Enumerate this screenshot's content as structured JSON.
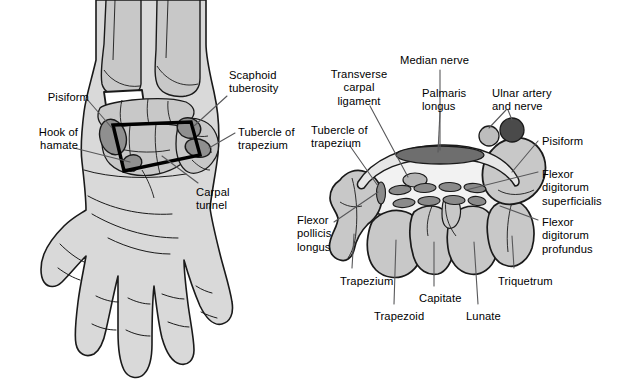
{
  "figure": {
    "background_color": "#ffffff",
    "line_color": "#1a1a1a",
    "leader_color": "#58585a",
    "fill_skin": "#d9d9d9",
    "fill_bone": "#c8c8c8",
    "fill_bone_dark": "#8f8f8f",
    "fill_tendon": "#8a8a8a",
    "fill_nerve": "#6e6e6e",
    "fill_artery": "#4a4a4a",
    "fill_tunnel_interior": "#f2f2f2"
  },
  "panels": [
    {
      "id": "left-panel",
      "name": "palmar-hand-view",
      "caption": "Palmar view of left hand showing the four bony boundaries of the carpal tunnel"
    },
    {
      "id": "right-panel",
      "name": "carpal-tunnel-cross-section",
      "caption": "Transverse cross-section through the carpal tunnel"
    }
  ],
  "labels_left": [
    {
      "key": "pisiform",
      "text": "Pisiform",
      "align": "right",
      "x": 42,
      "y": 91
    },
    {
      "key": "hook_of_hamate",
      "text": "Hook of\nhamate",
      "align": "right",
      "x": 29,
      "y": 126
    },
    {
      "key": "scaphoid_tuberosity",
      "text": "Scaphoid\ntuberosity",
      "align": "left",
      "x": 229,
      "y": 69
    },
    {
      "key": "tubercle_of_trapezium",
      "text": "Tubercle of\ntrapezium",
      "align": "left",
      "x": 238,
      "y": 126
    },
    {
      "key": "carpal_tunnel",
      "text": "Carpal\ntunnel",
      "align": "left",
      "x": 196,
      "y": 186
    }
  ],
  "labels_right": [
    {
      "key": "transverse_carpal_ligament",
      "text": "Transverse\ncarpal\nligament",
      "align": "center",
      "x": 321,
      "y": 68
    },
    {
      "key": "median_nerve",
      "text": "Median nerve",
      "align": "left",
      "x": 400,
      "y": 54
    },
    {
      "key": "palmaris_longus",
      "text": "Palmaris\nlongus",
      "align": "left",
      "x": 422,
      "y": 87
    },
    {
      "key": "ulnar_artery_and_nerve",
      "text": "Ulnar artery\nand nerve",
      "align": "left",
      "x": 492,
      "y": 87
    },
    {
      "key": "tubercle_of_trapezium_2",
      "text": "Tubercle of\ntrapezium",
      "align": "left",
      "x": 311,
      "y": 124
    },
    {
      "key": "pisiform_2",
      "text": "Pisiform",
      "align": "left",
      "x": 542,
      "y": 135
    },
    {
      "key": "flexor_digitorum_superficialis",
      "text": "Flexor\ndigitorum\nsuperficialis",
      "align": "left",
      "x": 542,
      "y": 168
    },
    {
      "key": "flexor_digitorum_profundus",
      "text": "Flexor\ndigitorum\nprofundus",
      "align": "left",
      "x": 542,
      "y": 216
    },
    {
      "key": "flexor_pollicis_longus",
      "text": "Flexor\npollicis\nlongus",
      "align": "left",
      "x": 297,
      "y": 214
    },
    {
      "key": "trapezium",
      "text": "Trapezium",
      "align": "left",
      "x": 340,
      "y": 275
    },
    {
      "key": "trapezoid",
      "text": "Trapezoid",
      "align": "left",
      "x": 374,
      "y": 310
    },
    {
      "key": "capitate",
      "text": "Capitate",
      "align": "left",
      "x": 419,
      "y": 292
    },
    {
      "key": "lunate",
      "text": "Lunate",
      "align": "left",
      "x": 466,
      "y": 310
    },
    {
      "key": "triquetrum",
      "text": "Triquetrum",
      "align": "left",
      "x": 498,
      "y": 275
    }
  ],
  "structures_left": [
    {
      "name": "hand-silhouette",
      "desc": "palm of hand, fingers pointing downward"
    },
    {
      "name": "radius-bone",
      "desc": "distal radius"
    },
    {
      "name": "ulna-bone",
      "desc": "distal ulna"
    },
    {
      "name": "pisiform-bone",
      "desc": "dark oval carpal bone, ulnar side"
    },
    {
      "name": "hook-of-hamate-bone",
      "desc": "dark hook process, distal ulnar"
    },
    {
      "name": "scaphoid-tuberosity-bone",
      "desc": "dark tuberosity, radial side"
    },
    {
      "name": "trapezium-tubercle-bone",
      "desc": "dark tubercle, distal radial"
    },
    {
      "name": "carpal-tunnel-outline",
      "desc": "thick black quadrilateral connecting the four bony landmarks"
    }
  ],
  "structures_right": [
    {
      "name": "transverse-carpal-ligament",
      "desc": "arching band roofing the tunnel"
    },
    {
      "name": "median-nerve-oval",
      "desc": "flattened dark ellipse above ligament"
    },
    {
      "name": "palmaris-longus-tendon",
      "desc": "small oval beneath median nerve marker"
    },
    {
      "name": "ulnar-artery-circle",
      "desc": "light circle"
    },
    {
      "name": "ulnar-nerve-circle",
      "desc": "dark circle"
    },
    {
      "name": "flexor-tendons-group",
      "desc": "two rows of four oval tendons inside the tunnel"
    },
    {
      "name": "flexor-pollicis-longus-tendon",
      "desc": "single vertical oval on radial side of tunnel"
    },
    {
      "name": "trapezium-bone",
      "desc": "carpal bone"
    },
    {
      "name": "trapezoid-bone",
      "desc": "carpal bone"
    },
    {
      "name": "capitate-bone",
      "desc": "carpal bone"
    },
    {
      "name": "lunate-bone",
      "desc": "carpal bone"
    },
    {
      "name": "triquetrum-bone",
      "desc": "carpal bone"
    },
    {
      "name": "pisiform-bone-2",
      "desc": "large rounded bone on ulnar side"
    }
  ]
}
